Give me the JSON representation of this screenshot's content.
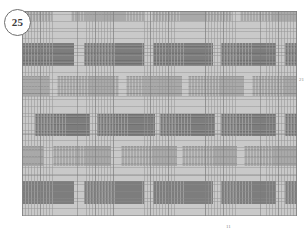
{
  "figure": {
    "badge_label": "25",
    "panel_background": "#c9c9c9",
    "dark_block_color": "#7d7d7d",
    "mid_block_color": "#a9a9a9",
    "page_background": "#ffffff"
  },
  "references": {
    "right_numeral": "21",
    "bottom_numeral": "11"
  },
  "panel": {
    "x": 22,
    "y": 11,
    "width": 275,
    "height": 205
  },
  "rows": [
    {
      "name": "row-top-mid",
      "tone": "mid",
      "top": 0,
      "height": 10,
      "blocks": [
        {
          "left": 1,
          "width": 29
        },
        {
          "left": 49,
          "width": 73
        },
        {
          "left": 130,
          "width": 80
        },
        {
          "left": 218,
          "width": 57
        }
      ]
    },
    {
      "name": "row-1-dark",
      "tone": "dark",
      "top": 32,
      "height": 23,
      "blocks": [
        {
          "left": 0,
          "width": 52
        },
        {
          "left": 62,
          "width": 60
        },
        {
          "left": 131,
          "width": 60
        },
        {
          "left": 199,
          "width": 55
        },
        {
          "left": 263,
          "width": 12
        }
      ]
    },
    {
      "name": "row-2-mid",
      "tone": "mid",
      "top": 65,
      "height": 20,
      "blocks": [
        {
          "left": 0,
          "width": 27
        },
        {
          "left": 35,
          "width": 62
        },
        {
          "left": 104,
          "width": 56
        },
        {
          "left": 166,
          "width": 56
        },
        {
          "left": 230,
          "width": 45
        }
      ]
    },
    {
      "name": "row-3-dark",
      "tone": "dark",
      "top": 103,
      "height": 22,
      "blocks": [
        {
          "left": 13,
          "width": 55
        },
        {
          "left": 75,
          "width": 58
        },
        {
          "left": 138,
          "width": 55
        },
        {
          "left": 199,
          "width": 55
        },
        {
          "left": 263,
          "width": 12
        }
      ]
    },
    {
      "name": "row-4-mid",
      "tone": "mid",
      "top": 135,
      "height": 20,
      "blocks": [
        {
          "left": 0,
          "width": 22
        },
        {
          "left": 31,
          "width": 58
        },
        {
          "left": 99,
          "width": 56
        },
        {
          "left": 160,
          "width": 55
        },
        {
          "left": 222,
          "width": 53
        }
      ]
    },
    {
      "name": "row-5-dark",
      "tone": "dark",
      "top": 170,
      "height": 23,
      "blocks": [
        {
          "left": 0,
          "width": 52
        },
        {
          "left": 62,
          "width": 60
        },
        {
          "left": 131,
          "width": 60
        },
        {
          "left": 199,
          "width": 55
        },
        {
          "left": 263,
          "width": 12
        }
      ]
    }
  ]
}
